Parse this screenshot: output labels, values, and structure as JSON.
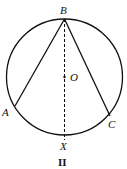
{
  "diagram": {
    "caption": "II",
    "circle": {
      "cx": 64.5,
      "cy": 77,
      "r": 58
    },
    "points": {
      "B": {
        "label": "B",
        "x": 64.5,
        "y": 19
      },
      "A": {
        "label": "A",
        "x": 15,
        "y": 106
      },
      "C": {
        "label": "C",
        "x": 110,
        "y": 116
      },
      "X": {
        "label": "X",
        "x": 64.5,
        "y": 135
      },
      "O": {
        "label": "O",
        "x": 64.5,
        "y": 77
      }
    },
    "segments": [
      {
        "from": "B",
        "to": "A",
        "style": "solid"
      },
      {
        "from": "B",
        "to": "C",
        "style": "solid"
      },
      {
        "from": "B",
        "to": "X",
        "style": "dashed"
      }
    ],
    "colors": {
      "stroke": "#111111",
      "background": "#ffffff"
    }
  }
}
